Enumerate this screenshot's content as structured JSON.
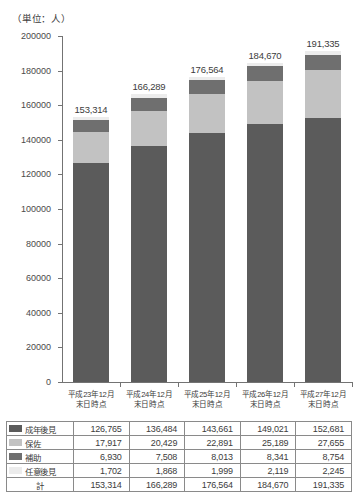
{
  "unit_caption": "（単位：人）",
  "chart_data": {
    "type": "bar",
    "stacked": true,
    "title": "",
    "subtitle": "",
    "xlabel": "",
    "ylabel": "（単位：人）",
    "ylim": [
      0,
      200000
    ],
    "ytick_step": 20000,
    "grid": false,
    "legend_position": "table-below",
    "categories": [
      "平成23年12月\n末日時点",
      "平成24年12月\n末日時点",
      "平成25年12月\n末日時点",
      "平成26年12月\n末日時点",
      "平成27年12月\n末日時点"
    ],
    "category_lines": [
      [
        "平成23年12月",
        "末日時点"
      ],
      [
        "平成24年12月",
        "末日時点"
      ],
      [
        "平成25年12月",
        "末日時点"
      ],
      [
        "平成26年12月",
        "末日時点"
      ],
      [
        "平成27年12月",
        "末日時点"
      ]
    ],
    "ytick_labels": [
      "200000",
      "180000",
      "160000",
      "140000",
      "120000",
      "100000",
      "80000",
      "60000",
      "40000",
      "20000",
      "0"
    ],
    "ytick_values": [
      200000,
      180000,
      160000,
      140000,
      120000,
      100000,
      80000,
      60000,
      40000,
      20000,
      0
    ],
    "series": [
      {
        "name": "成年後見",
        "color": "#5b5b5b",
        "values": [
          126765,
          136484,
          143661,
          149021,
          152681
        ],
        "labels": [
          "126,765",
          "136,484",
          "143,661",
          "149,021",
          "152,681"
        ]
      },
      {
        "name": "保佐",
        "color": "#c2c2c2",
        "values": [
          17917,
          20429,
          22891,
          25189,
          27655
        ],
        "labels": [
          "17,917",
          "20,429",
          "22,891",
          "25,189",
          "27,655"
        ]
      },
      {
        "name": "補助",
        "color": "#6f6f6f",
        "values": [
          6930,
          7508,
          8013,
          8341,
          8754
        ],
        "labels": [
          "6,930",
          "7,508",
          "8,013",
          "8,341",
          "8,754"
        ]
      },
      {
        "name": "任意後見",
        "color": "#ececec",
        "values": [
          1702,
          1868,
          1999,
          2119,
          2245
        ],
        "labels": [
          "1,702",
          "1,868",
          "1,999",
          "2,119",
          "2,245"
        ]
      }
    ],
    "totals": {
      "name": "計",
      "values": [
        153314,
        166289,
        176564,
        184670,
        191335
      ],
      "labels": [
        "153,314",
        "166,289",
        "176,564",
        "184,670",
        "191,335"
      ]
    },
    "bar_total_labels": [
      "153,314",
      "166,289",
      "176,564",
      "184,670",
      "191,335"
    ]
  },
  "table": {
    "rows": [
      {
        "name": "成年後見",
        "swatch": "seinen",
        "cells": [
          "126,765",
          "136,484",
          "143,661",
          "149,021",
          "152,681"
        ]
      },
      {
        "name": "保佐",
        "swatch": "hosa",
        "cells": [
          "17,917",
          "20,429",
          "22,891",
          "25,189",
          "27,655"
        ]
      },
      {
        "name": "補助",
        "swatch": "hojo",
        "cells": [
          "6,930",
          "7,508",
          "8,013",
          "8,341",
          "8,754"
        ]
      },
      {
        "name": "任意後見",
        "swatch": "nini",
        "cells": [
          "1,702",
          "1,868",
          "1,999",
          "2,119",
          "2,245"
        ]
      }
    ],
    "total_row": {
      "name": "計",
      "cells": [
        "153,314",
        "166,289",
        "176,564",
        "184,670",
        "191,335"
      ]
    }
  }
}
